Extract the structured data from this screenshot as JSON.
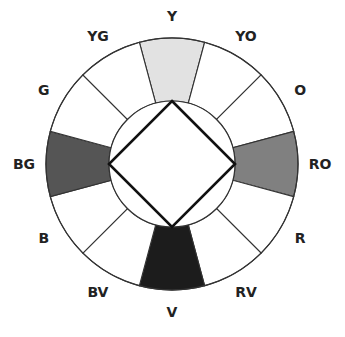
{
  "diagram": {
    "center": [
      172,
      164
    ],
    "outer_radius": 126,
    "inner_radius": 63,
    "label_radius": 148,
    "segments": [
      {
        "label": "Y",
        "angle": -90,
        "fill": "#e2e2e2"
      },
      {
        "label": "YO",
        "angle": -60,
        "fill": "#ffffff"
      },
      {
        "label": "O",
        "angle": -30,
        "fill": "#ffffff"
      },
      {
        "label": "RO",
        "angle": 0,
        "fill": "#808080"
      },
      {
        "label": "R",
        "angle": 30,
        "fill": "#ffffff"
      },
      {
        "label": "RV",
        "angle": 60,
        "fill": "#ffffff"
      },
      {
        "label": "V",
        "angle": 90,
        "fill": "#1c1c1c"
      },
      {
        "label": "BV",
        "angle": 120,
        "fill": "#ffffff"
      },
      {
        "label": "B",
        "angle": 150,
        "fill": "#ffffff"
      },
      {
        "label": "BG",
        "angle": 180,
        "fill": "#555555"
      },
      {
        "label": "G",
        "angle": 210,
        "fill": "#ffffff"
      },
      {
        "label": "YG",
        "angle": 240,
        "fill": "#ffffff"
      }
    ],
    "selected": [
      "Y",
      "RO",
      "V",
      "BG"
    ],
    "square_vertices": [
      [
        172,
        101
      ],
      [
        235,
        164
      ],
      [
        172,
        227
      ],
      [
        109,
        164
      ]
    ]
  }
}
